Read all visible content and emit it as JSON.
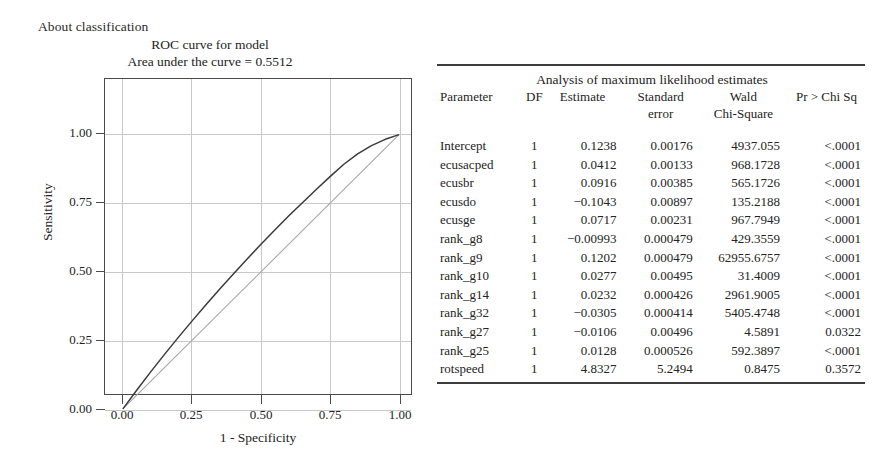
{
  "page": {
    "caption": "About classification"
  },
  "chart": {
    "title_line1": "ROC curve for model",
    "title_line2": "Area under the curve = 0.5512",
    "x_axis_title": "1 - Specificity",
    "y_axis_title": "Sensitivity",
    "xticklabels": [
      "0.00",
      "0.25",
      "0.50",
      "0.75",
      "1.00"
    ],
    "yticklabels": [
      "0.00",
      "0.25",
      "0.50",
      "0.75",
      "1.00"
    ]
  },
  "chart_data": {
    "type": "line",
    "title": "ROC curve for model",
    "subtitle": "Area under the curve = 0.5512",
    "xlabel": "1 - Specificity",
    "ylabel": "Sensitivity",
    "xlim": [
      0,
      1
    ],
    "ylim": [
      0,
      1
    ],
    "xticks": [
      0.0,
      0.25,
      0.5,
      0.75,
      1.0
    ],
    "yticks": [
      0.0,
      0.25,
      0.5,
      0.75,
      1.0
    ],
    "grid": true,
    "legend": "none",
    "auc": 0.5512,
    "series": [
      {
        "name": "ROC curve",
        "x": [
          0.0,
          0.05,
          0.1,
          0.15,
          0.2,
          0.25,
          0.3,
          0.35,
          0.4,
          0.45,
          0.5,
          0.55,
          0.6,
          0.65,
          0.7,
          0.75,
          0.8,
          0.85,
          0.9,
          0.95,
          1.0
        ],
        "y": [
          0.0,
          0.068,
          0.134,
          0.198,
          0.26,
          0.32,
          0.379,
          0.436,
          0.492,
          0.547,
          0.6,
          0.652,
          0.703,
          0.752,
          0.8,
          0.847,
          0.892,
          0.93,
          0.96,
          0.983,
          1.0
        ]
      },
      {
        "name": "Reference diagonal",
        "x": [
          0.0,
          1.0
        ],
        "y": [
          0.0,
          1.0
        ]
      }
    ]
  },
  "table": {
    "caption": "Analysis of maximum likelihood estimates",
    "headers_line1": [
      "Parameter",
      "DF",
      "Estimate",
      "Standard",
      "Wald",
      "Pr > Chi Sq"
    ],
    "headers_line2": [
      "",
      "",
      "",
      "error",
      "Chi-Square",
      ""
    ],
    "rows": [
      {
        "parameter": "Intercept",
        "df": "1",
        "estimate": "0.1238",
        "standard_error": "0.00176",
        "wald_chi_square": "4937.055",
        "pr_chi_sq": "<.0001"
      },
      {
        "parameter": "ecusacped",
        "df": "1",
        "estimate": "0.0412",
        "standard_error": "0.00133",
        "wald_chi_square": "968.1728",
        "pr_chi_sq": "<.0001"
      },
      {
        "parameter": "ecusbr",
        "df": "1",
        "estimate": "0.0916",
        "standard_error": "0.00385",
        "wald_chi_square": "565.1726",
        "pr_chi_sq": "<.0001"
      },
      {
        "parameter": "ecusdo",
        "df": "1",
        "estimate": "−0.1043",
        "standard_error": "0.00897",
        "wald_chi_square": "135.2188",
        "pr_chi_sq": "<.0001"
      },
      {
        "parameter": "ecusge",
        "df": "1",
        "estimate": "0.0717",
        "standard_error": "0.00231",
        "wald_chi_square": "967.7949",
        "pr_chi_sq": "<.0001"
      },
      {
        "parameter": "rank_g8",
        "df": "1",
        "estimate": "−0.00993",
        "standard_error": "0.000479",
        "wald_chi_square": "429.3559",
        "pr_chi_sq": "<.0001"
      },
      {
        "parameter": "rank_g9",
        "df": "1",
        "estimate": "0.1202",
        "standard_error": "0.000479",
        "wald_chi_square": "62955.6757",
        "pr_chi_sq": "<.0001"
      },
      {
        "parameter": "rank_g10",
        "df": "1",
        "estimate": "0.0277",
        "standard_error": "0.00495",
        "wald_chi_square": "31.4009",
        "pr_chi_sq": "<.0001"
      },
      {
        "parameter": "rank_g14",
        "df": "1",
        "estimate": "0.0232",
        "standard_error": "0.000426",
        "wald_chi_square": "2961.9005",
        "pr_chi_sq": "<.0001"
      },
      {
        "parameter": "rank_g32",
        "df": "1",
        "estimate": "−0.0305",
        "standard_error": "0.000414",
        "wald_chi_square": "5405.4748",
        "pr_chi_sq": "<.0001"
      },
      {
        "parameter": "rank_g27",
        "df": "1",
        "estimate": "−0.0106",
        "standard_error": "0.00496",
        "wald_chi_square": "4.5891",
        "pr_chi_sq": "0.0322"
      },
      {
        "parameter": "rank_g25",
        "df": "1",
        "estimate": "0.0128",
        "standard_error": "0.000526",
        "wald_chi_square": "592.3897",
        "pr_chi_sq": "<.0001"
      },
      {
        "parameter": "rotspeed",
        "df": "1",
        "estimate": "4.8327",
        "standard_error": "5.2494",
        "wald_chi_square": "0.8475",
        "pr_chi_sq": "0.3572"
      }
    ]
  },
  "colors": {
    "axis": "#4a4a4a",
    "grid": "#c9c9c9",
    "curve": "#3a3a3a",
    "diagonal": "#a8a8a8",
    "rule": "#3b3b3b",
    "text": "#232323",
    "background": "#ffffff"
  }
}
